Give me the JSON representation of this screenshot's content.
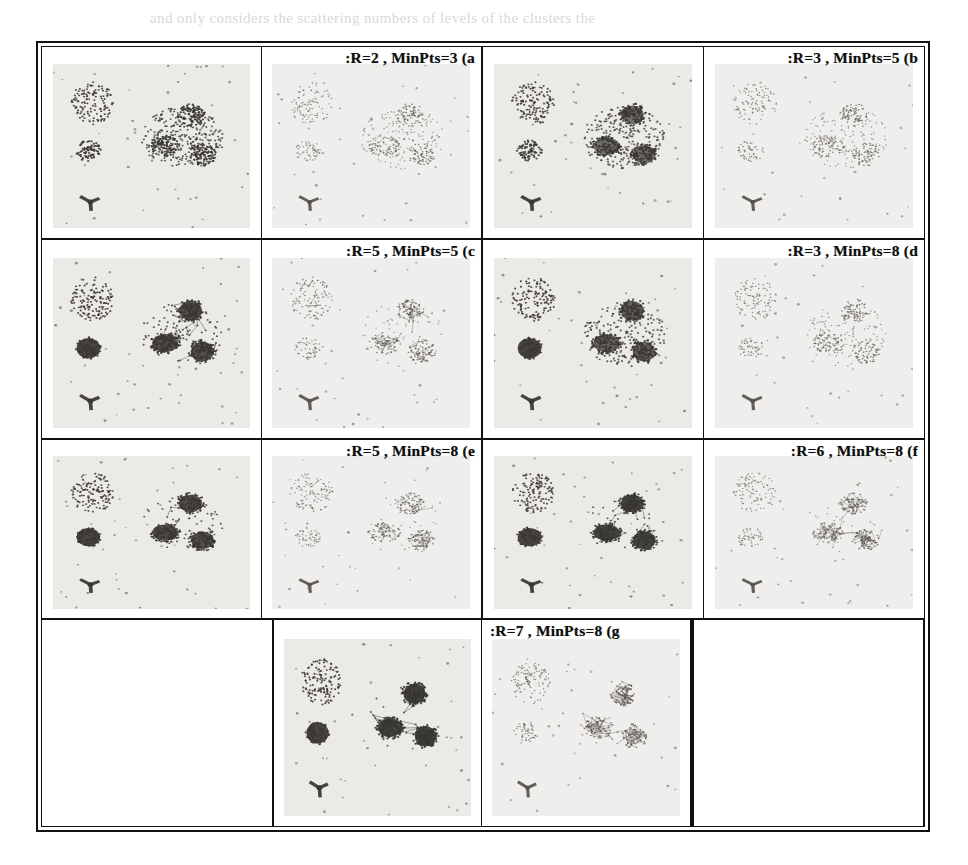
{
  "figure": {
    "kind": "clustering-parameter-grid",
    "panel_count": 7,
    "paper_background": "#ffffff",
    "frame_color": "#111111",
    "plate_color": "#eceae6",
    "ink_color": "#3a3732"
  },
  "panels": [
    {
      "id": "a",
      "label": ":R=2 , MinPts=3 (a",
      "R": 2,
      "MinPts": 3,
      "caption_align": "right",
      "row": 1,
      "col": 1,
      "edge_density": 0.0,
      "blob_fill": 0.62,
      "halo": 1.0,
      "result_tone": 0.4
    },
    {
      "id": "b",
      "label": ":R=3 , MinPts=5 (b",
      "R": 3,
      "MinPts": 5,
      "caption_align": "right",
      "row": 1,
      "col": 2,
      "edge_density": 0.05,
      "blob_fill": 0.78,
      "halo": 0.85,
      "result_tone": 0.45
    },
    {
      "id": "c",
      "label": ":R=5 , MinPts=5 (c",
      "R": 5,
      "MinPts": 5,
      "caption_align": "right",
      "row": 2,
      "col": 1,
      "edge_density": 0.55,
      "blob_fill": 0.95,
      "halo": 0.35,
      "result_tone": 0.6
    },
    {
      "id": "d",
      "label": ":R=3 , MinPts=8 (d",
      "R": 3,
      "MinPts": 8,
      "caption_align": "right",
      "row": 2,
      "col": 2,
      "edge_density": 0.05,
      "blob_fill": 0.85,
      "halo": 0.7,
      "result_tone": 0.42
    },
    {
      "id": "e",
      "label": ":R=5 , MinPts=8 (e",
      "R": 5,
      "MinPts": 8,
      "caption_align": "right",
      "row": 3,
      "col": 1,
      "edge_density": 0.45,
      "blob_fill": 0.95,
      "halo": 0.25,
      "result_tone": 0.55
    },
    {
      "id": "f",
      "label": ":R=6 , MinPts=8 (f",
      "R": 6,
      "MinPts": 8,
      "caption_align": "right",
      "row": 3,
      "col": 2,
      "edge_density": 0.75,
      "blob_fill": 1.0,
      "halo": 0.12,
      "result_tone": 0.62
    },
    {
      "id": "g",
      "label": ":R=7 , MinPts=8 (g",
      "R": 7,
      "MinPts": 8,
      "caption_align": "left",
      "row": 4,
      "col": 2,
      "edge_density": 0.95,
      "blob_fill": 1.0,
      "halo": 0.05,
      "result_tone": 0.7
    }
  ],
  "chart_data": {
    "type": "scatter",
    "title": "",
    "xlabel": "",
    "ylabel": "",
    "xlim": [
      0,
      100
    ],
    "ylim": [
      0,
      100
    ],
    "grid": false,
    "legend": null,
    "features": [
      {
        "name": "sparse-upper-left-cluster",
        "cx": 20,
        "cy": 76,
        "rx": 11,
        "ry": 13,
        "points": 120,
        "density": "sparse"
      },
      {
        "name": "small-dense-left-cluster",
        "cx": 18,
        "cy": 47,
        "rx": 6.5,
        "ry": 6.5,
        "points": 70,
        "density": "dense"
      },
      {
        "name": "y-shaped-mark",
        "cx": 19,
        "cy": 16,
        "rx": 7,
        "ry": 6,
        "points": 0,
        "density": "glyph"
      },
      {
        "name": "diffuse-right-region",
        "cx": 66,
        "cy": 55,
        "rx": 21,
        "ry": 19,
        "points": 320,
        "density": "diffuse-halo"
      },
      {
        "name": "right-core-top",
        "cx": 70,
        "cy": 69,
        "rx": 7,
        "ry": 7,
        "points": 90,
        "density": "dense-core"
      },
      {
        "name": "right-core-left",
        "cx": 57,
        "cy": 50,
        "rx": 8,
        "ry": 6.5,
        "points": 95,
        "density": "dense-core"
      },
      {
        "name": "right-core-bottom",
        "cx": 76,
        "cy": 45,
        "rx": 7,
        "ry": 7,
        "points": 88,
        "density": "dense-core"
      }
    ],
    "series": [
      {
        "name": "noise-specks",
        "values": 45
      },
      {
        "name": "cluster-cores",
        "values": 5
      }
    ]
  },
  "bleed_text": {
    "lines": [
      {
        "text": "and only considers the scattering numbers of levels of the clusters the",
        "x": 150,
        "y": 10,
        "size": 15
      },
      {
        "text": "clustering approach to the density based spatial clustering of",
        "x": 58,
        "y": 62,
        "size": 15
      },
      {
        "text": "applications with noise. The algorithm requires two",
        "x": 58,
        "y": 88,
        "size": 15
      },
      {
        "text": "parameters, the radius R and the minimum number of points",
        "x": 58,
        "y": 114,
        "size": 15
      },
      {
        "text": "MinPts. A point is a core point when it has more than",
        "x": 58,
        "y": 140,
        "size": 15
      },
      {
        "text": "MinPts neighbours within the radius R of that point.",
        "x": 58,
        "y": 166,
        "size": 15
      },
      {
        "text": "Figure shows the results for different parameter settings.",
        "x": 58,
        "y": 192,
        "size": 15
      },
      {
        "text": "We can see that a small radius produces many small",
        "x": 58,
        "y": 264,
        "size": 15
      },
      {
        "text": "clusters, while a large radius merges everything into one.",
        "x": 58,
        "y": 290,
        "size": 15
      },
      {
        "text": "The connectivity of the neighbourhood graph grows",
        "x": 58,
        "y": 316,
        "size": 15
      },
      {
        "text": "monotonically with R, so the number of clusters first",
        "x": 58,
        "y": 342,
        "size": 15
      },
      {
        "text": "rises and then falls as R is increased further.",
        "x": 58,
        "y": 368,
        "size": 15
      },
      {
        "text": "We chose the values of R that gave stable results",
        "x": 58,
        "y": 394,
        "size": 15
      },
      {
        "text": "and compared them with the ground truth labels.",
        "x": 58,
        "y": 420,
        "size": 15
      },
      {
        "text": "The results are summarised in the table below.",
        "x": 58,
        "y": 446,
        "size": 15
      },
      {
        "text": "clustering result depends strongly on the choice of the",
        "x": 58,
        "y": 758,
        "size": 15
      },
      {
        "text": "two parameters, so a careful selection is needed.",
        "x": 58,
        "y": 784,
        "size": 15
      }
    ]
  }
}
